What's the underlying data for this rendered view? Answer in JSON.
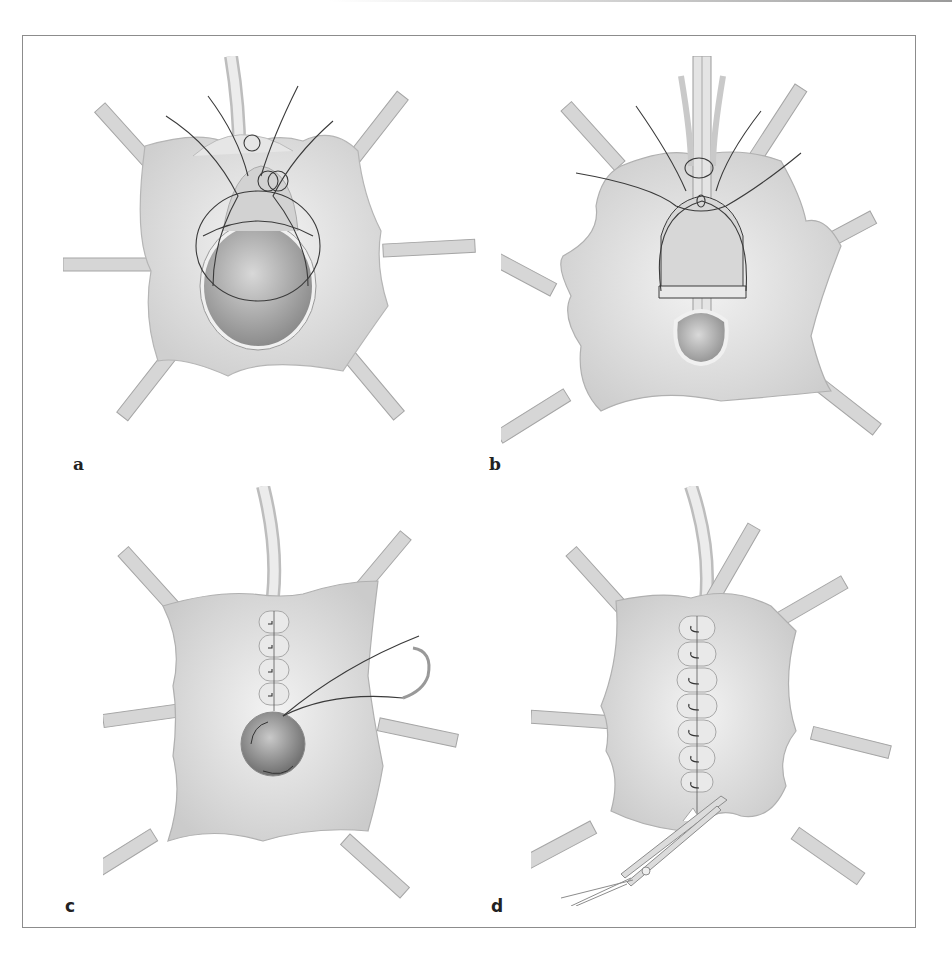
{
  "figure": {
    "panels": [
      {
        "id": "a",
        "label": "a",
        "description": "Opened tissue retracted by six clamps with large round defect and encircling purse-string sutures"
      },
      {
        "id": "b",
        "label": "b",
        "description": "Catheter inserted through sutures with smaller teardrop opening below"
      },
      {
        "id": "c",
        "label": "c",
        "description": "Partially closed incision with running sutures; needle and thread at lower round defect"
      },
      {
        "id": "d",
        "label": "d",
        "description": "Fully sutured closure; scissors trimming lower edge"
      }
    ],
    "colors": {
      "tissue": "#e2e2e2",
      "tissue_shadow": "#bdbdbd",
      "clamp": "#d4d4d4",
      "suture": "#3a3a3a",
      "frame": "#8c8c8c"
    }
  }
}
